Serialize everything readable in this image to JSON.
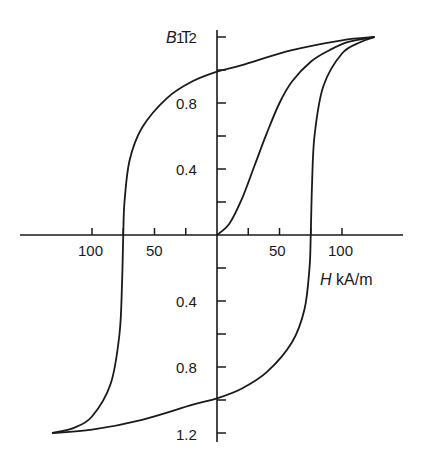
{
  "chart_data": {
    "type": "line",
    "title": "",
    "xlabel": "H kA/m",
    "ylabel": "B T",
    "x_axis_symbol": "H",
    "x_axis_unit": "kA/m",
    "y_axis_symbol": "B",
    "y_axis_unit": "T",
    "xlim": [
      -140,
      150
    ],
    "ylim": [
      -1.25,
      1.25
    ],
    "x_tick_labels": [
      "100",
      "50",
      "50",
      "100"
    ],
    "x_tick_values": [
      -100,
      -50,
      50,
      100
    ],
    "y_tick_labels_upper": [
      "1.2",
      "0.8",
      "0.4"
    ],
    "y_tick_labels_lower": [
      "0.4",
      "0.8",
      "1.2"
    ],
    "y_tick_values": [
      1.2,
      0.8,
      0.4,
      -0.4,
      -0.8,
      -1.2
    ],
    "grid": false,
    "series": [
      {
        "name": "Initial magnetization curve",
        "x": [
          0,
          10,
          20,
          30,
          40,
          50,
          60,
          75,
          90,
          105,
          126
        ],
        "y": [
          0,
          0.07,
          0.22,
          0.42,
          0.62,
          0.8,
          0.93,
          1.05,
          1.12,
          1.17,
          1.2
        ]
      },
      {
        "name": "Descending branch",
        "x": [
          126,
          100,
          60,
          20,
          0,
          -20,
          -40,
          -60,
          -70,
          -74,
          -75,
          -76,
          -78,
          -85,
          -100,
          -115,
          -132
        ],
        "y": [
          1.2,
          1.18,
          1.12,
          1.03,
          0.99,
          0.93,
          0.83,
          0.65,
          0.45,
          0.2,
          0,
          -0.3,
          -0.6,
          -0.9,
          -1.1,
          -1.17,
          -1.2
        ]
      },
      {
        "name": "Ascending branch",
        "x": [
          -132,
          -100,
          -60,
          -20,
          0,
          20,
          40,
          60,
          70,
          74,
          75,
          76,
          78,
          85,
          100,
          115,
          126
        ],
        "y": [
          -1.2,
          -1.18,
          -1.12,
          -1.03,
          -0.99,
          -0.93,
          -0.83,
          -0.65,
          -0.45,
          -0.2,
          0,
          0.3,
          0.6,
          0.9,
          1.1,
          1.17,
          1.2
        ]
      }
    ],
    "annotations": {
      "saturation_B": 1.2,
      "remanence_B": 1.0,
      "coercivity_H": 75
    }
  }
}
